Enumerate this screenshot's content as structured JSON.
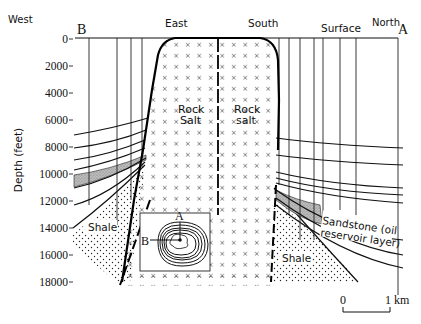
{
  "diagram": {
    "type": "geological cross-section of a salt dome",
    "direction_labels": {
      "west": "West",
      "east": "East",
      "south": "South",
      "north": "North",
      "surface": "Surface"
    },
    "section_endpoints": {
      "left": "B",
      "right": "A"
    },
    "y_axis": {
      "label": "Depth (feet)",
      "ticks": [
        "0",
        "2000",
        "4000",
        "6000",
        "8000",
        "10000",
        "12000",
        "14000",
        "16000",
        "18000"
      ]
    },
    "formations": {
      "rock_salt_left": [
        "Rock",
        "Salt"
      ],
      "rock_salt_right": [
        "Rock",
        "salt"
      ],
      "shale_left": "Shale",
      "shale_right": "Shale",
      "sandstone": [
        "Sandstone (oil",
        "reservoir layer)"
      ]
    },
    "inset_map": {
      "description": "plan view of salt dome with contour lines",
      "label_a": "A",
      "label_b": "B"
    },
    "scale_bar": {
      "start": "0",
      "end": "1 km"
    },
    "colors": {
      "ink": "#111111",
      "background": "#ffffff",
      "sandstone_fill": "#b8b8b8"
    }
  }
}
